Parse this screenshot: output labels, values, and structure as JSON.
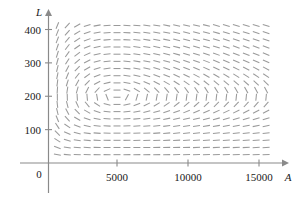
{
  "figure": {
    "title": "",
    "background_color": "#ffffff"
  },
  "axes": {
    "x_label": "A",
    "y_label": "L",
    "x_ticks": [
      {
        "value": 5000,
        "label": "5000"
      },
      {
        "value": 10000,
        "label": "10000"
      },
      {
        "value": 15000,
        "label": "15000"
      }
    ],
    "y_ticks": [
      {
        "value": 100,
        "label": "100"
      },
      {
        "value": 200,
        "label": "200"
      },
      {
        "value": 300,
        "label": "300"
      },
      {
        "value": 400,
        "label": "400"
      }
    ],
    "origin_label": "0",
    "axis_color": "#8a8a8a",
    "label_color": "#1a1a1a"
  },
  "chart_data": {
    "type": "scatter",
    "subtype": "direction-field",
    "title": "",
    "xlabel": "A",
    "ylabel": "L",
    "xlim": [
      0,
      16200
    ],
    "ylim": [
      0,
      440
    ],
    "grid": false,
    "legend": null,
    "field_color": "#9a9a9a",
    "segment_length_px": 7.0,
    "sample_grid": {
      "x_start": 800,
      "x_step": 700,
      "x_count": 23,
      "y_start": 25,
      "y_step": 21.5,
      "y_count": 19
    },
    "model": {
      "description": "Predator-prey (aphid-ladybug) direction field dA/dt = 2A - 0.01AL, dL/dt = -0.5L + 0.0001AL",
      "dA_coeff_growth": 2.0,
      "dA_coeff_predation": 0.01,
      "dL_coeff_death": 0.5,
      "dL_coeff_gain": 0.0001,
      "equilibrium": {
        "A": 5000,
        "L": 200
      },
      "x_scale_for_slope": 0.0125
    },
    "annotations": []
  }
}
